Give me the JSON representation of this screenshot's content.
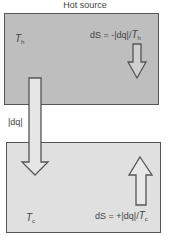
{
  "title": "Hot source",
  "hot_reservoir": {
    "temperature_symbol": "T",
    "temperature_subscript": "h",
    "entropy_prefix": "dS = -|dq|/",
    "entropy_T": "T",
    "entropy_sub": "h",
    "fill_color": "#bebebe"
  },
  "cold_reservoir": {
    "temperature_symbol": "T",
    "temperature_subscript": "c",
    "entropy_prefix": "dS = +|dq|/",
    "entropy_T": "T",
    "entropy_sub": "c",
    "fill_color": "#e0e0e0"
  },
  "heat_flow_label": "|dq|",
  "border_color": "#555555"
}
